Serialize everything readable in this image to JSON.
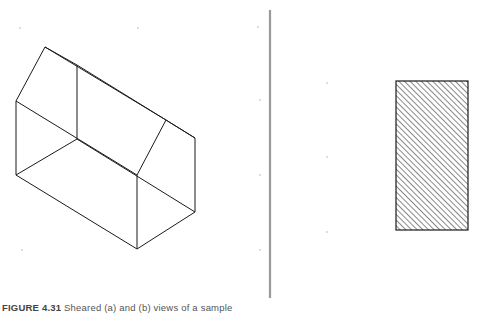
{
  "figure": {
    "caption_label": "FIGURE 4.31",
    "caption_text": "Sheared (a) and (b) views of a sample",
    "panels": [
      {
        "id": "left",
        "description": "Wireframe isometric view of a house-shaped prism (pentagonal prism)"
      },
      {
        "id": "right",
        "description": "Hatched rectangle (sectioned orthographic view)"
      }
    ]
  },
  "colors": {
    "line": "#1a1a1a",
    "divider": "#9a9a9a",
    "hatch": "#444444",
    "dots": "#b0b0b0"
  }
}
